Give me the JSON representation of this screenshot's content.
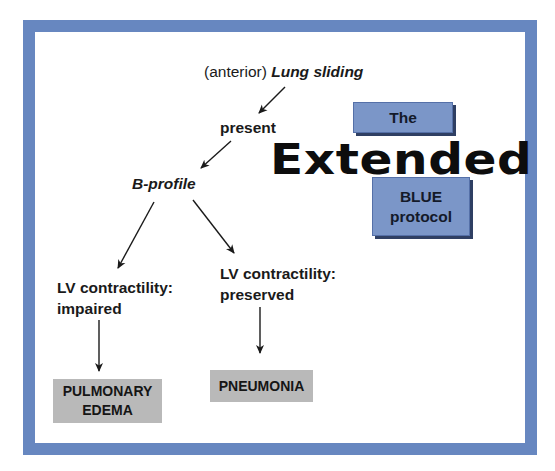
{
  "diagram": {
    "title_parts": {
      "box_top": "The",
      "middle": "Extended",
      "box_bottom_line1": "BLUE",
      "box_bottom_line2": "protocol"
    },
    "nodes": {
      "start_prefix": "(anterior)",
      "start_main": "Lung sliding",
      "present": "present",
      "b_profile": "B-profile",
      "lv_impaired_line1": "LV contractility:",
      "lv_impaired_line2": "impaired",
      "lv_preserved_line1": "LV contractility:",
      "lv_preserved_line2": "preserved",
      "outcome_left_line1": "PULMONARY",
      "outcome_left_line2": "EDEMA",
      "outcome_right": "PNEUMONIA"
    },
    "edges": [
      {
        "from": "Lung sliding",
        "to": "present"
      },
      {
        "from": "present",
        "to": "B-profile"
      },
      {
        "from": "B-profile",
        "to": "LV contractility: impaired"
      },
      {
        "from": "B-profile",
        "to": "LV contractility: preserved"
      },
      {
        "from": "LV contractility: impaired",
        "to": "PULMONARY EDEMA"
      },
      {
        "from": "LV contractility: preserved",
        "to": "PNEUMONIA"
      }
    ],
    "colors": {
      "frame": "#6787c0",
      "blue_box": "#7b96c8",
      "gray_box": "#b9b9b9"
    }
  }
}
